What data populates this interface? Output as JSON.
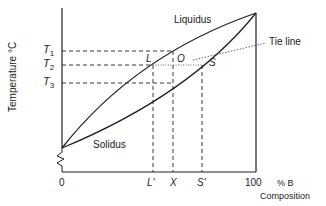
{
  "axes": {
    "y_label": "Temperature °C",
    "x_label": "Composition",
    "x_unit": "% B",
    "x_ticks": [
      "0",
      "L'",
      "X",
      "S'",
      "100"
    ],
    "y_ticks": [
      "T1",
      "T2",
      "T3"
    ]
  },
  "curves": {
    "liquidus": "Liquidus",
    "solidus": "Solidus"
  },
  "points": {
    "L": "L",
    "O": "O",
    "S": "S"
  },
  "annotations": {
    "tie_line": "Tie line"
  },
  "colors": {
    "line": "#222222",
    "background": "#ffffff"
  }
}
